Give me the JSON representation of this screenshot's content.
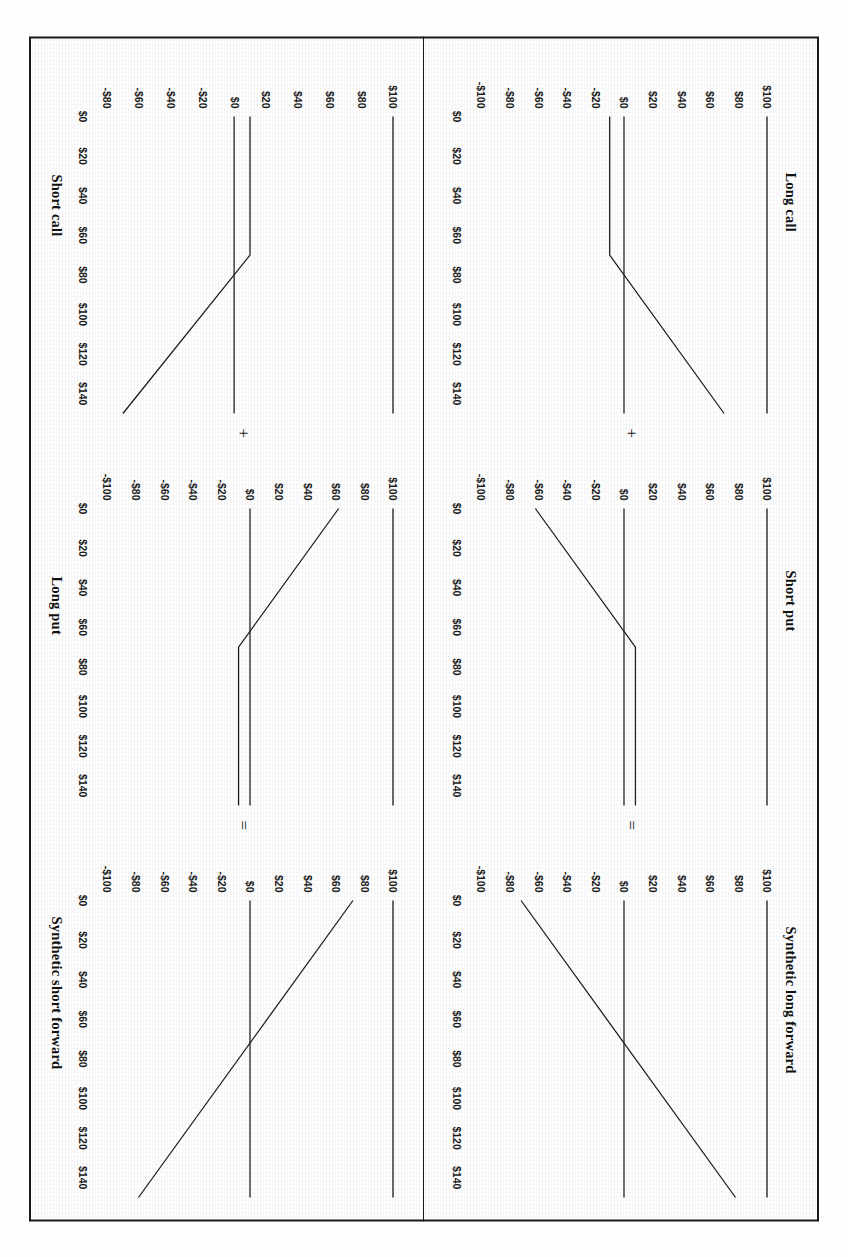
{
  "figure": {
    "orientation_note": "rotated",
    "operators": {
      "plus": "+",
      "equals": "="
    }
  },
  "chart_data": [
    {
      "type": "line",
      "title": "Long call",
      "xlabel": "",
      "ylabel": "",
      "xticks": [
        "$0",
        "$20",
        "$40",
        "$60",
        "$80",
        "$100",
        "$120",
        "$140"
      ],
      "xvalues": [
        0,
        20,
        40,
        60,
        80,
        100,
        120,
        140
      ],
      "yticks": [
        "$100",
        "$80",
        "$60",
        "$40",
        "$20",
        "$0",
        "-$20",
        "-$40",
        "-$60",
        "-$80",
        "-$100"
      ],
      "yvalues": [
        100,
        80,
        60,
        40,
        20,
        0,
        -20,
        -40,
        -60,
        -80,
        -100
      ],
      "xlim": [
        0,
        150
      ],
      "ylim": [
        -100,
        100
      ],
      "grid": false,
      "legend": "none",
      "series": [
        {
          "name": "zero line",
          "x": [
            0,
            150
          ],
          "y": [
            0,
            0
          ]
        },
        {
          "name": "long call payoff",
          "x": [
            0,
            70,
            150
          ],
          "y": [
            -10,
            -10,
            70
          ]
        }
      ]
    },
    {
      "type": "line",
      "title": "Short put",
      "xlabel": "",
      "ylabel": "",
      "xticks": [
        "$0",
        "$20",
        "$40",
        "$60",
        "$80",
        "$100",
        "$120",
        "$140"
      ],
      "xvalues": [
        0,
        20,
        40,
        60,
        80,
        100,
        120,
        140
      ],
      "yticks": [
        "$100",
        "$80",
        "$60",
        "$40",
        "$20",
        "$0",
        "-$20",
        "-$40",
        "-$60",
        "-$80",
        "-$100"
      ],
      "yvalues": [
        100,
        80,
        60,
        40,
        20,
        0,
        -20,
        -40,
        -60,
        -80,
        -100
      ],
      "xlim": [
        0,
        150
      ],
      "ylim": [
        -100,
        100
      ],
      "grid": false,
      "legend": "none",
      "series": [
        {
          "name": "zero line",
          "x": [
            0,
            150
          ],
          "y": [
            0,
            0
          ]
        },
        {
          "name": "short put payoff",
          "x": [
            0,
            70,
            150
          ],
          "y": [
            -62,
            8,
            8
          ]
        }
      ]
    },
    {
      "type": "line",
      "title": "Synthetic long forward",
      "xlabel": "",
      "ylabel": "",
      "xticks": [
        "$0",
        "$20",
        "$40",
        "$60",
        "$80",
        "$100",
        "$120",
        "$140"
      ],
      "xvalues": [
        0,
        20,
        40,
        60,
        80,
        100,
        120,
        140
      ],
      "yticks": [
        "$100",
        "$80",
        "$60",
        "$40",
        "$20",
        "$0",
        "-$20",
        "-$40",
        "-$60",
        "-$80",
        "-$100"
      ],
      "yvalues": [
        100,
        80,
        60,
        40,
        20,
        0,
        -20,
        -40,
        -60,
        -80,
        -100
      ],
      "xlim": [
        0,
        150
      ],
      "ylim": [
        -100,
        100
      ],
      "grid": false,
      "legend": "none",
      "series": [
        {
          "name": "zero line",
          "x": [
            0,
            150
          ],
          "y": [
            0,
            0
          ]
        },
        {
          "name": "synthetic long forward payoff",
          "x": [
            0,
            150
          ],
          "y": [
            -72,
            78
          ]
        }
      ]
    },
    {
      "type": "line",
      "title": "Short call",
      "xlabel": "",
      "ylabel": "",
      "xticks": [
        "$0",
        "$20",
        "$40",
        "$60",
        "$80",
        "$100",
        "$120",
        "$140"
      ],
      "xvalues": [
        0,
        20,
        40,
        60,
        80,
        100,
        120,
        140
      ],
      "yticks": [
        "$100",
        "$80",
        "$60",
        "$40",
        "$20",
        "$0",
        "-$20",
        "-$40",
        "-$60",
        "-$80"
      ],
      "yvalues": [
        100,
        80,
        60,
        40,
        20,
        0,
        -20,
        -40,
        -60,
        -80
      ],
      "xlim": [
        0,
        150
      ],
      "ylim": [
        -80,
        100
      ],
      "grid": false,
      "legend": "none",
      "series": [
        {
          "name": "zero line",
          "x": [
            0,
            150
          ],
          "y": [
            0,
            0
          ]
        },
        {
          "name": "short call payoff",
          "x": [
            0,
            70,
            150
          ],
          "y": [
            10,
            10,
            -70
          ]
        }
      ]
    },
    {
      "type": "line",
      "title": "Long put",
      "xlabel": "",
      "ylabel": "",
      "xticks": [
        "$0",
        "$20",
        "$40",
        "$60",
        "$80",
        "$100",
        "$120",
        "$140"
      ],
      "xvalues": [
        0,
        20,
        40,
        60,
        80,
        100,
        120,
        140
      ],
      "yticks": [
        "$100",
        "$80",
        "$60",
        "$40",
        "$20",
        "$0",
        "-$20",
        "-$40",
        "-$60",
        "-$80",
        "-$100"
      ],
      "yvalues": [
        100,
        80,
        60,
        40,
        20,
        0,
        -20,
        -40,
        -60,
        -80,
        -100
      ],
      "xlim": [
        0,
        150
      ],
      "ylim": [
        -100,
        100
      ],
      "grid": false,
      "legend": "none",
      "series": [
        {
          "name": "zero line",
          "x": [
            0,
            150
          ],
          "y": [
            0,
            0
          ]
        },
        {
          "name": "long put payoff",
          "x": [
            0,
            70,
            150
          ],
          "y": [
            62,
            -8,
            -8
          ]
        }
      ]
    },
    {
      "type": "line",
      "title": "Synthetic short forward",
      "xlabel": "",
      "ylabel": "",
      "xticks": [
        "$0",
        "$20",
        "$40",
        "$60",
        "$80",
        "$100",
        "$120",
        "$140"
      ],
      "xvalues": [
        0,
        20,
        40,
        60,
        80,
        100,
        120,
        140
      ],
      "yticks": [
        "$100",
        "$80",
        "$60",
        "$40",
        "$20",
        "$0",
        "-$20",
        "-$40",
        "-$60",
        "-$80",
        "-$100"
      ],
      "yvalues": [
        100,
        80,
        60,
        40,
        20,
        0,
        -20,
        -40,
        -60,
        -80,
        -100
      ],
      "xlim": [
        0,
        150
      ],
      "ylim": [
        -100,
        100
      ],
      "grid": false,
      "legend": "none",
      "series": [
        {
          "name": "zero line",
          "x": [
            0,
            150
          ],
          "y": [
            0,
            0
          ]
        },
        {
          "name": "synthetic short forward payoff",
          "x": [
            0,
            150
          ],
          "y": [
            72,
            -78
          ]
        }
      ]
    }
  ]
}
